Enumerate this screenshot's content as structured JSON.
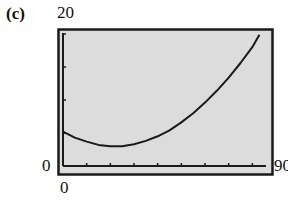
{
  "panel": {
    "label": "(c)"
  },
  "window": {
    "xmin_label": "0",
    "xmax_label": "90",
    "ymin_label": "0",
    "ymax_label": "20"
  },
  "colors": {
    "screen_bg": "#dcdcdc",
    "frame": "#1a1a1a",
    "curve": "#1a1a1a"
  },
  "chart_data": {
    "type": "line",
    "title": "",
    "xlabel": "",
    "ylabel": "",
    "xlim": [
      0,
      90
    ],
    "ylim": [
      0,
      20
    ],
    "x_tick_step": 10,
    "y_tick_step": 5,
    "grid": false,
    "legend": null,
    "series": [
      {
        "name": "curve",
        "x": [
          0,
          5,
          10,
          15,
          20,
          22,
          25,
          30,
          35,
          40,
          45,
          50,
          55,
          60,
          65,
          70,
          75,
          80,
          83
        ],
        "y": [
          5.2,
          4.3,
          3.7,
          3.2,
          3.0,
          3.0,
          3.0,
          3.3,
          3.8,
          4.5,
          5.4,
          6.6,
          8.0,
          9.6,
          11.4,
          13.4,
          15.6,
          18.0,
          19.9
        ]
      }
    ]
  }
}
